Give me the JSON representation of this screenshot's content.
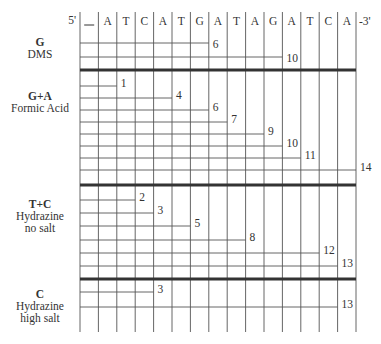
{
  "sequence": {
    "five_prime": "5'",
    "three_prime": "-3'",
    "bases": [
      "_",
      "A",
      "T",
      "C",
      "A",
      "T",
      "G",
      "A",
      "T",
      "A",
      "G",
      "A",
      "T",
      "C",
      "A"
    ]
  },
  "lanes": [
    {
      "reaction": "G",
      "reagent": "DMS",
      "reagent_line2": "",
      "fragments": [
        6,
        10
      ]
    },
    {
      "reaction": "G+A",
      "reagent": "Formic Acid",
      "reagent_line2": "",
      "fragments": [
        1,
        4,
        6,
        7,
        9,
        10,
        11,
        14
      ]
    },
    {
      "reaction": "T+C",
      "reagent": "Hydrazine",
      "reagent_line2": "no salt",
      "fragments": [
        2,
        3,
        5,
        8,
        12,
        13
      ]
    },
    {
      "reaction": "C",
      "reagent": "Hydrazine",
      "reagent_line2": "high salt",
      "fragments": [
        3,
        13
      ]
    }
  ],
  "colors": {
    "line": "#555555",
    "thick": "#333333",
    "text": "#333333"
  }
}
